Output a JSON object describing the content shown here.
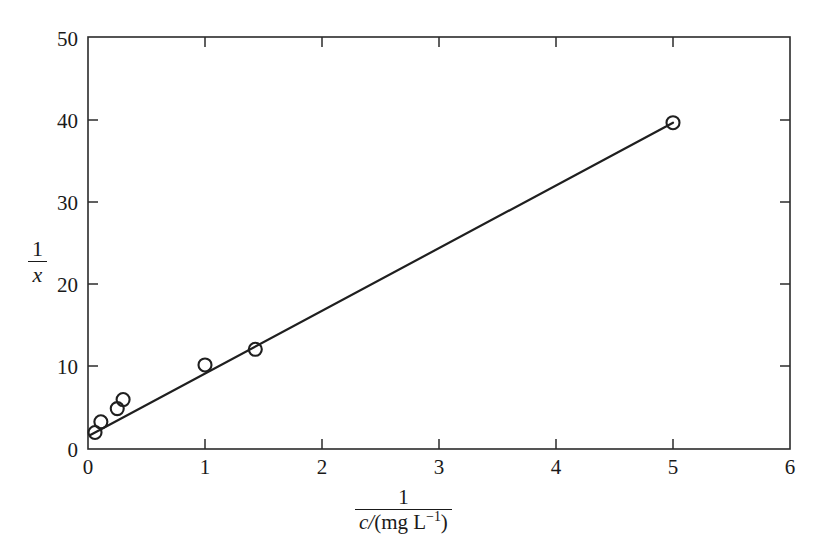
{
  "chart_data": {
    "type": "scatter",
    "title": "",
    "subtitle": "",
    "xlabel": "1 / (c/(mg L^-1))",
    "ylabel": "1/x",
    "xlabel_parts": {
      "numerator": "1",
      "denominator_var": "c",
      "denominator_slash": "/",
      "denominator_unit_open": "(mg L",
      "denominator_unit_exp": "−1",
      "denominator_unit_close": ")"
    },
    "ylabel_parts": {
      "numerator": "1",
      "denominator": "x"
    },
    "xlim": [
      0,
      6
    ],
    "ylim": [
      0,
      50
    ],
    "xticks": [
      0,
      1,
      2,
      3,
      4,
      5,
      6
    ],
    "yticks": [
      0,
      10,
      20,
      30,
      40,
      50
    ],
    "xtick_labels": [
      "0",
      "1",
      "2",
      "3",
      "4",
      "5",
      "6"
    ],
    "ytick_labels": [
      "0",
      "10",
      "20",
      "30",
      "40",
      "50"
    ],
    "grid": false,
    "legend": false,
    "legend_position": "none",
    "frame": "box",
    "tick_direction": "in",
    "marker": "open-circle",
    "marker_color": "#1f1f1f",
    "line_color": "#1f1f1f",
    "background_color": "#ffffff",
    "series": [
      {
        "name": "data",
        "kind": "scatter",
        "marker": "open-circle",
        "points": [
          {
            "x": 0.06,
            "y": 2.0
          },
          {
            "x": 0.11,
            "y": 3.3
          },
          {
            "x": 0.25,
            "y": 4.9
          },
          {
            "x": 0.3,
            "y": 6.0
          },
          {
            "x": 1.0,
            "y": 10.2
          },
          {
            "x": 1.43,
            "y": 12.1
          },
          {
            "x": 5.0,
            "y": 39.6
          }
        ]
      },
      {
        "name": "best-fit line",
        "kind": "line",
        "endpoints": [
          {
            "x": 0.02,
            "y": 1.7
          },
          {
            "x": 5.0,
            "y": 39.6
          }
        ]
      }
    ]
  }
}
